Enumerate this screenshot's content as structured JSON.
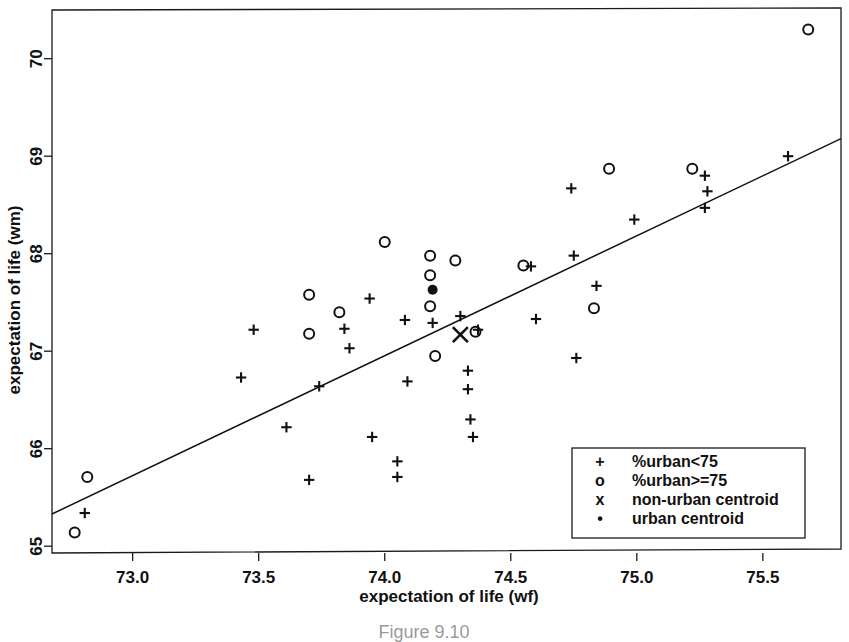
{
  "caption": "Figure 9.10",
  "chart_data": {
    "type": "scatter",
    "title": "",
    "xlabel": "expectation of life (wf)",
    "ylabel": "expectation of life (wm)",
    "xlim": [
      72.68,
      75.81
    ],
    "ylim": [
      64.93,
      70.52
    ],
    "xticks": [
      "73.0",
      "73.5",
      "74.0",
      "74.5",
      "75.0",
      "75.5"
    ],
    "xtick_values": [
      73.0,
      73.5,
      74.0,
      74.5,
      75.0,
      75.5
    ],
    "yticks": [
      "65",
      "66",
      "67",
      "68",
      "69",
      "70"
    ],
    "ytick_values": [
      65,
      66,
      67,
      68,
      69,
      70
    ],
    "grid": false,
    "legend_position": "bottom-right",
    "legend": [
      {
        "symbol": "+",
        "label": "%urban<75"
      },
      {
        "symbol": "o",
        "label": "%urban>=75"
      },
      {
        "symbol": "x",
        "label": "non-urban centroid"
      },
      {
        "symbol": "•",
        "label": "urban centroid"
      }
    ],
    "trend_line": {
      "x": [
        72.68,
        75.81
      ],
      "y": [
        65.33,
        69.18
      ]
    },
    "series": [
      {
        "name": "%urban<75",
        "marker": "plus",
        "points": [
          [
            72.81,
            65.34
          ],
          [
            73.48,
            67.22
          ],
          [
            73.43,
            66.73
          ],
          [
            73.61,
            66.22
          ],
          [
            73.7,
            65.68
          ],
          [
            73.74,
            66.64
          ],
          [
            73.84,
            67.23
          ],
          [
            73.86,
            67.03
          ],
          [
            73.94,
            67.54
          ],
          [
            73.95,
            66.12
          ],
          [
            74.05,
            65.87
          ],
          [
            74.05,
            65.71
          ],
          [
            74.08,
            67.32
          ],
          [
            74.09,
            66.69
          ],
          [
            74.19,
            67.29
          ],
          [
            74.3,
            67.36
          ],
          [
            74.33,
            66.8
          ],
          [
            74.33,
            66.61
          ],
          [
            74.34,
            66.3
          ],
          [
            74.35,
            66.12
          ],
          [
            74.37,
            67.22
          ],
          [
            74.58,
            67.87
          ],
          [
            74.6,
            67.33
          ],
          [
            74.75,
            67.98
          ],
          [
            74.74,
            68.67
          ],
          [
            74.76,
            66.93
          ],
          [
            74.84,
            67.67
          ],
          [
            74.99,
            68.35
          ],
          [
            75.27,
            68.8
          ],
          [
            75.28,
            68.64
          ],
          [
            75.27,
            68.47
          ],
          [
            75.6,
            69.0
          ]
        ]
      },
      {
        "name": "%urban>=75",
        "marker": "circle",
        "points": [
          [
            72.77,
            65.14
          ],
          [
            72.82,
            65.71
          ],
          [
            73.7,
            67.58
          ],
          [
            73.7,
            67.18
          ],
          [
            73.82,
            67.4
          ],
          [
            74.0,
            68.12
          ],
          [
            74.18,
            67.98
          ],
          [
            74.18,
            67.78
          ],
          [
            74.18,
            67.46
          ],
          [
            74.2,
            66.95
          ],
          [
            74.28,
            67.93
          ],
          [
            74.36,
            67.2
          ],
          [
            74.55,
            67.88
          ],
          [
            74.83,
            67.44
          ],
          [
            74.89,
            68.87
          ],
          [
            75.22,
            68.87
          ],
          [
            75.68,
            70.3
          ]
        ]
      },
      {
        "name": "non-urban centroid",
        "marker": "ex",
        "points": [
          [
            74.3,
            67.17
          ]
        ]
      },
      {
        "name": "urban centroid",
        "marker": "dot",
        "points": [
          [
            74.19,
            67.63
          ]
        ]
      }
    ]
  }
}
